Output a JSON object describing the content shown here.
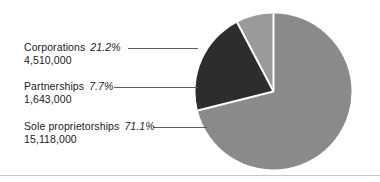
{
  "chart_data": {
    "type": "pie",
    "title": "",
    "subtitle": "",
    "xlabel": "",
    "ylabel": "",
    "legend_position": "inline-labels-left",
    "grid": false,
    "start_angle_deg": 0,
    "direction": "clockwise",
    "categories": [
      "Sole proprietorships",
      "Corporations",
      "Partnerships"
    ],
    "values": [
      71.1,
      21.2,
      7.7
    ],
    "counts": [
      15118000,
      4510000,
      1643000
    ],
    "slices": [
      {
        "name": "Sole proprietorships",
        "percent": 71.1,
        "percent_label": "71.1%",
        "count": 15118000,
        "count_label": "15,118,000",
        "color": "#8a8a8a"
      },
      {
        "name": "Corporations",
        "percent": 21.2,
        "percent_label": "21.2%",
        "count": 4510000,
        "count_label": "4,510,000",
        "color": "#2d2d2d"
      },
      {
        "name": "Partnerships",
        "percent": 7.7,
        "percent_label": "7.7%",
        "count": 1643000,
        "count_label": "1,643,000",
        "color": "#9a9a9a"
      }
    ]
  },
  "labels": {
    "corporations": {
      "name": "Corporations",
      "percent": "21.2%",
      "count": "4,510,000"
    },
    "partnerships": {
      "name": "Partnerships",
      "percent": "7.7%",
      "count": "1,643,000"
    },
    "sole_proprietorships": {
      "name": "Sole proprietorships",
      "percent": "71.1%",
      "count": "15,118,000"
    }
  },
  "colors": {
    "sole_proprietorships": "#8a8a8a",
    "corporations": "#2d2d2d",
    "partnerships": "#9a9a9a",
    "separator": "#ffffff",
    "leader_line": "#5d5d5d",
    "text": "#1b1b1b",
    "rule": "#c8c8c8",
    "background": "#ffffff"
  }
}
